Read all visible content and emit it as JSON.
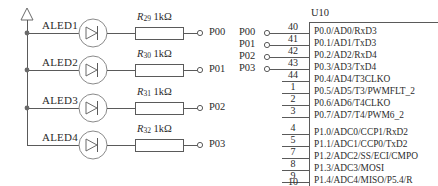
{
  "diagram": {
    "power_symbol": "vcc-triangle",
    "line_color": "#5a5a5a",
    "text_color": "#2b2b2b"
  },
  "led_rows": [
    {
      "led_label": "ALED1",
      "resistor_ref": "R",
      "resistor_sub": "29",
      "resistor_value": "1kΩ",
      "port_label": "P00"
    },
    {
      "led_label": "ALED2",
      "resistor_ref": "R",
      "resistor_sub": "30",
      "resistor_value": "1kΩ",
      "port_label": "P01"
    },
    {
      "led_label": "ALED3",
      "resistor_ref": "R",
      "resistor_sub": "31",
      "resistor_value": "1kΩ",
      "port_label": "P02"
    },
    {
      "led_label": "ALED4",
      "resistor_ref": "R",
      "resistor_sub": "32",
      "resistor_value": "1kΩ",
      "port_label": "P03"
    }
  ],
  "net_ports": [
    {
      "label": "P00"
    },
    {
      "label": "P01"
    },
    {
      "label": "P02"
    },
    {
      "label": "P03"
    }
  ],
  "ic": {
    "name": "U10",
    "port0_pins": [
      {
        "number": "40",
        "signal": "P0.0/AD0/RxD3"
      },
      {
        "number": "41",
        "signal": "P0.1/AD1/TxD3"
      },
      {
        "number": "42",
        "signal": "P0.2/AD2/RxD4"
      },
      {
        "number": "43",
        "signal": "P0.3/AD3/TxD4"
      },
      {
        "number": "44",
        "signal": "P0.4/AD4/T3CLKO"
      },
      {
        "number": "1",
        "signal": "P0.5/AD5/T3/PWMFLT_2"
      },
      {
        "number": "2",
        "signal": "P0.6/AD6/T4CLKO"
      },
      {
        "number": "3",
        "signal": "P0.7/AD7/T4/PWM6_2"
      }
    ],
    "port1_pins": [
      {
        "number": "4",
        "signal": "P1.0/ADC0/CCP1/RxD2"
      },
      {
        "number": "5",
        "signal": "P1.1/ADC1/CCP0/TxD2"
      },
      {
        "number": "7",
        "signal": "P1.2/ADC2/SS/ECI/CMPO"
      },
      {
        "number": "8",
        "signal": "P1.3/ADC3/MOSI"
      },
      {
        "number": "9",
        "signal": "P1.4/ADC4/MISO/P5.4/R"
      },
      {
        "number": "10",
        "signal": ""
      }
    ]
  }
}
